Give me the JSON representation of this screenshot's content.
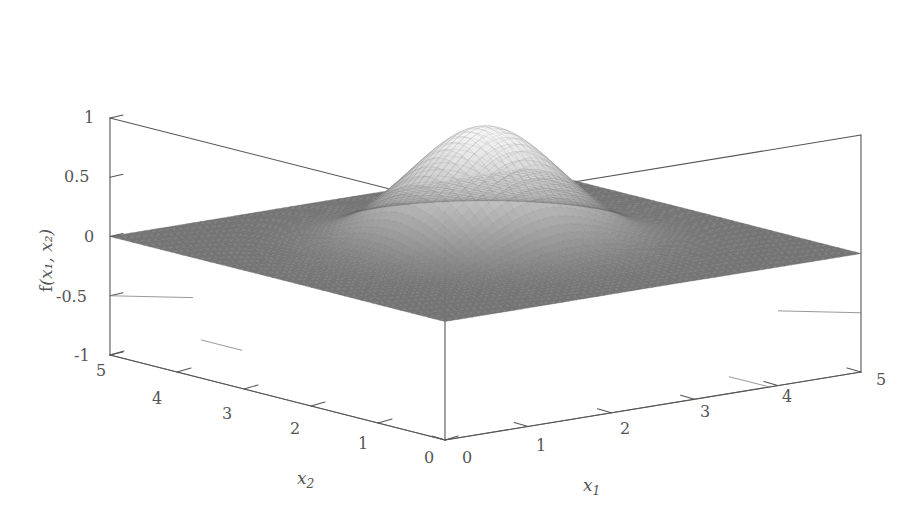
{
  "figure": {
    "kind": "3d-surface-mesh-plot",
    "background_color": "#ffffff",
    "line_color": "#555555",
    "mesh_dark_color": "#6e6e6e",
    "mesh_light_color": "#f2f2f2"
  },
  "axes": {
    "z": {
      "title_fn": "f",
      "title_args": "(x₁, x₂)",
      "ticks": [
        "1",
        "0.5",
        "0",
        "-0.5",
        "-1"
      ],
      "values": [
        1,
        0.5,
        0,
        -0.5,
        -1
      ],
      "range": [
        -1,
        1
      ]
    },
    "x1": {
      "title_base": "x",
      "title_sub": "1",
      "ticks": [
        "0",
        "1",
        "2",
        "3",
        "4",
        "5"
      ],
      "values": [
        0,
        1,
        2,
        3,
        4,
        5
      ],
      "range": [
        0,
        5
      ]
    },
    "x2": {
      "title_base": "x",
      "title_sub": "2",
      "ticks": [
        "5",
        "4",
        "3",
        "2",
        "1",
        "0"
      ],
      "values": [
        5,
        4,
        3,
        2,
        1,
        0
      ],
      "range": [
        0,
        5
      ]
    }
  },
  "chart_data": {
    "type": "surface",
    "title": "",
    "xlabel": "x₁",
    "ylabel": "x₂",
    "zlabel": "f(x₁, x₂)",
    "xlim": [
      0,
      5
    ],
    "ylim": [
      0,
      5
    ],
    "zlim": [
      -1,
      1
    ],
    "xticks": [
      0,
      1,
      2,
      3,
      4,
      5
    ],
    "yticks": [
      0,
      1,
      2,
      3,
      4,
      5
    ],
    "zticks": [
      -1,
      -0.5,
      0,
      0.5,
      1
    ],
    "grid": false,
    "legend": false,
    "colormap": "grayscale",
    "mesh_resolution": [
      60,
      60
    ],
    "surface_model": {
      "formula": "f(x1,x2) = exp(-((x1-2.5)^2 + (x2-2.5)^2) / (2*0.72^2))",
      "peak_value": 1.0,
      "peak_x1": 2.5,
      "peak_x2": 2.5,
      "sigma": 0.72,
      "baseline": 0.0
    },
    "sampled_values": {
      "note": "z = f(x1,x2) on a 0..5 grid, step 0.5; rows are x2 = 0,0.5,...,5",
      "x": [
        0,
        0.5,
        1,
        1.5,
        2,
        2.5,
        3,
        3.5,
        4,
        4.5,
        5
      ],
      "y": [
        0,
        0.5,
        1,
        1.5,
        2,
        2.5,
        3,
        3.5,
        4,
        4.5,
        5
      ],
      "z": [
        [
          0.0,
          0.0,
          0.0,
          0.0,
          0.0,
          0.0,
          0.0,
          0.0,
          0.0,
          0.0,
          0.0
        ],
        [
          0.0,
          0.0,
          0.0,
          0.0,
          0.01,
          0.01,
          0.01,
          0.0,
          0.0,
          0.0,
          0.0
        ],
        [
          0.0,
          0.0,
          0.01,
          0.04,
          0.1,
          0.14,
          0.1,
          0.04,
          0.01,
          0.0,
          0.0
        ],
        [
          0.0,
          0.0,
          0.04,
          0.17,
          0.42,
          0.57,
          0.42,
          0.17,
          0.04,
          0.0,
          0.0
        ],
        [
          0.0,
          0.01,
          0.1,
          0.42,
          0.79,
          0.89,
          0.79,
          0.42,
          0.1,
          0.01,
          0.0
        ],
        [
          0.0,
          0.01,
          0.14,
          0.57,
          0.89,
          1.0,
          0.89,
          0.57,
          0.14,
          0.01,
          0.0
        ],
        [
          0.0,
          0.01,
          0.1,
          0.42,
          0.79,
          0.89,
          0.79,
          0.42,
          0.1,
          0.01,
          0.0
        ],
        [
          0.0,
          0.0,
          0.04,
          0.17,
          0.42,
          0.57,
          0.42,
          0.17,
          0.04,
          0.0,
          0.0
        ],
        [
          0.0,
          0.0,
          0.01,
          0.04,
          0.1,
          0.14,
          0.1,
          0.04,
          0.01,
          0.0,
          0.0
        ],
        [
          0.0,
          0.0,
          0.0,
          0.0,
          0.01,
          0.01,
          0.01,
          0.0,
          0.0,
          0.0,
          0.0
        ],
        [
          0.0,
          0.0,
          0.0,
          0.0,
          0.0,
          0.0,
          0.0,
          0.0,
          0.0,
          0.0,
          0.0
        ]
      ]
    }
  },
  "labels": {
    "z": [
      {
        "text": "1",
        "x": 84,
        "y": 110
      },
      {
        "text": "0.5",
        "x": 64,
        "y": 169
      },
      {
        "text": "0",
        "x": 84,
        "y": 229
      },
      {
        "text": "-0.5",
        "x": 56,
        "y": 289
      },
      {
        "text": "-1",
        "x": 74,
        "y": 348
      }
    ],
    "x2": [
      {
        "text": "5",
        "x": 96,
        "y": 363
      },
      {
        "text": "4",
        "x": 152,
        "y": 391
      },
      {
        "text": "3",
        "x": 222,
        "y": 406
      },
      {
        "text": "2",
        "x": 290,
        "y": 421
      },
      {
        "text": "1",
        "x": 358,
        "y": 436
      },
      {
        "text": "0",
        "x": 424,
        "y": 450
      }
    ],
    "x1": [
      {
        "text": "0",
        "x": 462,
        "y": 450
      },
      {
        "text": "1",
        "x": 536,
        "y": 438
      },
      {
        "text": "2",
        "x": 620,
        "y": 421
      },
      {
        "text": "3",
        "x": 700,
        "y": 404
      },
      {
        "text": "4",
        "x": 782,
        "y": 389
      },
      {
        "text": "5",
        "x": 876,
        "y": 372
      }
    ]
  }
}
